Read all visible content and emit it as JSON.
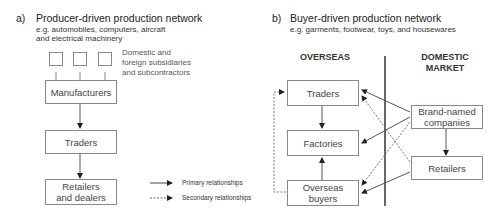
{
  "panel_a": {
    "label": "a)",
    "title": "Producer-driven production network",
    "subtitle_line1": "e.g. automobiles, computers, aircraft",
    "subtitle_line2": "and electrical machinery",
    "subsidiaries_note_line1": "Domestic and",
    "subsidiaries_note_line2": "foreign subsidiaries",
    "subsidiaries_note_line3": "and subcontractors",
    "nodes": {
      "manufacturers": "Manufacturers",
      "traders": "Traders",
      "retailers_line1": "Retailers",
      "retailers_line2": "and dealers"
    }
  },
  "legend": {
    "primary": "Primary relationships",
    "secondary": "Secondary relationships"
  },
  "panel_b": {
    "label": "b)",
    "title": "Buyer-driven production network",
    "subtitle": "e.g. garments, footwear, toys, and housewares",
    "overseas_header": "OVERSEAS",
    "domestic_header_line1": "DOMESTIC",
    "domestic_header_line2": "MARKET",
    "nodes": {
      "traders": "Traders",
      "factories": "Factories",
      "overseas_buyers_line1": "Overseas",
      "overseas_buyers_line2": "buyers",
      "brand_line1": "Brand-named",
      "brand_line2": "companies",
      "retailers": "Retailers"
    }
  }
}
